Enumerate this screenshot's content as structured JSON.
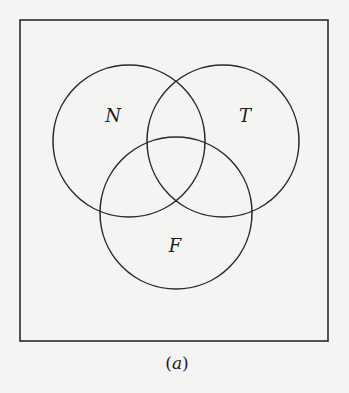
{
  "figure": {
    "caption_parts": {
      "open": "(",
      "letter": "a",
      "close": ")"
    },
    "universe": {
      "x": 20,
      "y": 20,
      "width": 308,
      "height": 321
    },
    "sets": [
      {
        "label": "N",
        "cx": 129,
        "cy": 141,
        "r": 76,
        "label_x": 113,
        "label_y": 122
      },
      {
        "label": "T",
        "cx": 223,
        "cy": 141,
        "r": 76,
        "label_x": 245,
        "label_y": 122
      },
      {
        "label": "F",
        "cx": 176,
        "cy": 213,
        "r": 76,
        "label_x": 175,
        "label_y": 252
      }
    ],
    "colors": {
      "background": "#f4f4f2",
      "stroke": "#2a2a2a",
      "text": "#1c1c1c"
    }
  }
}
